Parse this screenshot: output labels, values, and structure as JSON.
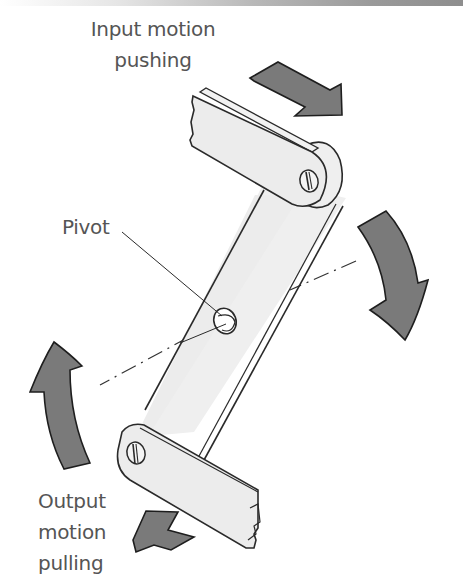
{
  "diagram": {
    "labels": {
      "input": {
        "line1": "Input motion",
        "line2": "pushing"
      },
      "pivot": "Pivot",
      "output": {
        "line1": "Output",
        "line2": "motion",
        "line3": "pulling"
      }
    },
    "components": [
      {
        "id": "top-link",
        "description": "Input link bar with slotted screw joint"
      },
      {
        "id": "lever",
        "description": "Central lever rotating about pivot"
      },
      {
        "id": "pivot",
        "description": "Fixed pivot point at center of lever"
      },
      {
        "id": "bottom-link",
        "description": "Output link bar with slotted screw joint"
      },
      {
        "id": "centerline",
        "description": "Dash-dot rotation reference line"
      }
    ],
    "arrows": [
      {
        "id": "input-arrow",
        "direction": "down-right",
        "meaning": "input push"
      },
      {
        "id": "rotation-arrow-right",
        "direction": "clockwise-down",
        "meaning": "lever rotation"
      },
      {
        "id": "rotation-arrow-left",
        "direction": "clockwise-up",
        "meaning": "lever rotation"
      },
      {
        "id": "output-arrow",
        "direction": "up-left",
        "meaning": "output pull"
      }
    ],
    "colors": {
      "arrow_fill": "#7a7a7a",
      "part_fill": "#eeeeee",
      "outline": "#2a2a2a",
      "text": "#555555"
    }
  }
}
